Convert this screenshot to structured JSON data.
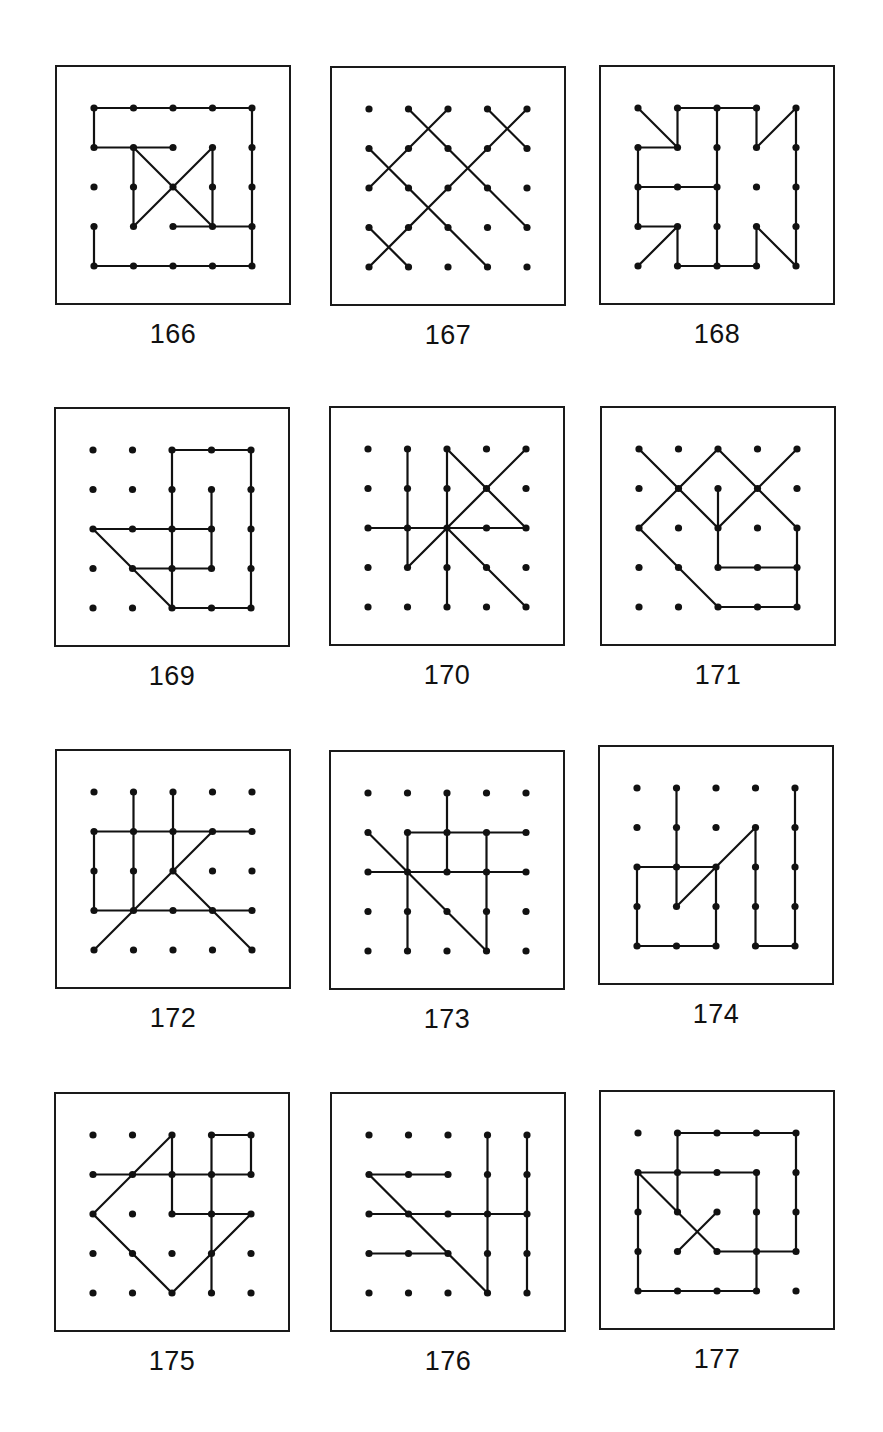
{
  "page": {
    "grid": {
      "cols": 5,
      "rows": 5,
      "spacing": 39.5,
      "inset_x": 37,
      "inset_y": 41
    },
    "colors": {
      "line": "#111111",
      "dot": "#111111",
      "border": "#1a1a1a",
      "background": "#ffffff"
    }
  },
  "panels": [
    {
      "number": "166",
      "x": 55,
      "y": 65,
      "lines": [
        [
          0,
          0,
          4,
          0
        ],
        [
          0,
          0,
          0,
          1
        ],
        [
          0,
          1,
          2,
          1
        ],
        [
          1,
          1,
          1,
          3
        ],
        [
          1,
          1,
          3,
          3
        ],
        [
          3,
          1,
          1,
          3
        ],
        [
          3,
          1,
          3,
          3
        ],
        [
          2,
          3,
          4,
          3
        ],
        [
          4,
          0,
          4,
          4
        ],
        [
          0,
          3,
          0,
          4
        ],
        [
          0,
          4,
          4,
          4
        ]
      ]
    },
    {
      "number": "167",
      "x": 330,
      "y": 66,
      "lines": [
        [
          2,
          0,
          0,
          2
        ],
        [
          1,
          0,
          4,
          3
        ],
        [
          3,
          0,
          4,
          1
        ],
        [
          4,
          0,
          0,
          4
        ],
        [
          0,
          1,
          3,
          4
        ],
        [
          0,
          3,
          1,
          4
        ]
      ]
    },
    {
      "number": "168",
      "x": 599,
      "y": 65,
      "lines": [
        [
          0,
          0,
          1,
          1
        ],
        [
          1,
          0,
          1,
          1
        ],
        [
          1,
          0,
          3,
          0
        ],
        [
          2,
          0,
          2,
          4
        ],
        [
          3,
          0,
          3,
          1
        ],
        [
          3,
          1,
          4,
          0
        ],
        [
          4,
          0,
          4,
          4
        ],
        [
          0,
          1,
          1,
          1
        ],
        [
          0,
          1,
          0,
          3
        ],
        [
          0,
          2,
          2,
          2
        ],
        [
          0,
          3,
          1,
          3
        ],
        [
          1,
          3,
          0,
          4
        ],
        [
          1,
          3,
          1,
          4
        ],
        [
          1,
          4,
          3,
          4
        ],
        [
          3,
          3,
          3,
          4
        ],
        [
          3,
          3,
          4,
          4
        ]
      ]
    },
    {
      "number": "169",
      "x": 54,
      "y": 407,
      "lines": [
        [
          2,
          0,
          4,
          0
        ],
        [
          2,
          0,
          2,
          4
        ],
        [
          4,
          0,
          4,
          4
        ],
        [
          3,
          1,
          3,
          3
        ],
        [
          0,
          2,
          3,
          2
        ],
        [
          0,
          2,
          2,
          4
        ],
        [
          1,
          3,
          3,
          3
        ],
        [
          2,
          4,
          4,
          4
        ]
      ]
    },
    {
      "number": "170",
      "x": 329,
      "y": 406,
      "lines": [
        [
          1,
          0,
          1,
          3
        ],
        [
          2,
          0,
          2,
          4
        ],
        [
          2,
          0,
          4,
          2
        ],
        [
          4,
          0,
          1,
          3
        ],
        [
          0,
          2,
          4,
          2
        ],
        [
          2,
          2,
          4,
          4
        ]
      ]
    },
    {
      "number": "171",
      "x": 600,
      "y": 406,
      "lines": [
        [
          0,
          0,
          2,
          2
        ],
        [
          2,
          0,
          0,
          2
        ],
        [
          2,
          0,
          4,
          2
        ],
        [
          4,
          0,
          2,
          2
        ],
        [
          2,
          1,
          2,
          3
        ],
        [
          0,
          2,
          2,
          4
        ],
        [
          2,
          3,
          4,
          3
        ],
        [
          4,
          2,
          4,
          4
        ],
        [
          2,
          4,
          4,
          4
        ]
      ]
    },
    {
      "number": "172",
      "x": 55,
      "y": 749,
      "lines": [
        [
          1,
          0,
          1,
          3
        ],
        [
          2,
          0,
          2,
          2
        ],
        [
          0,
          1,
          4,
          1
        ],
        [
          0,
          1,
          0,
          3
        ],
        [
          3,
          1,
          0,
          4
        ],
        [
          0,
          3,
          4,
          3
        ],
        [
          2,
          2,
          4,
          4
        ]
      ]
    },
    {
      "number": "173",
      "x": 329,
      "y": 750,
      "lines": [
        [
          2,
          0,
          2,
          2
        ],
        [
          1,
          1,
          4,
          1
        ],
        [
          1,
          1,
          1,
          4
        ],
        [
          3,
          1,
          3,
          4
        ],
        [
          0,
          1,
          3,
          4
        ],
        [
          0,
          2,
          4,
          2
        ]
      ]
    },
    {
      "number": "174",
      "x": 598,
      "y": 745,
      "lines": [
        [
          1,
          0,
          1,
          3
        ],
        [
          4,
          0,
          4,
          4
        ],
        [
          3,
          1,
          1,
          3
        ],
        [
          3,
          1,
          3,
          4
        ],
        [
          0,
          2,
          2,
          2
        ],
        [
          0,
          2,
          0,
          4
        ],
        [
          2,
          2,
          2,
          4
        ],
        [
          0,
          4,
          2,
          4
        ],
        [
          3,
          4,
          4,
          4
        ]
      ]
    },
    {
      "number": "175",
      "x": 54,
      "y": 1092,
      "lines": [
        [
          2,
          0,
          0,
          2
        ],
        [
          2,
          0,
          2,
          2
        ],
        [
          3,
          0,
          4,
          0
        ],
        [
          3,
          0,
          3,
          4
        ],
        [
          4,
          0,
          4,
          1
        ],
        [
          0,
          1,
          4,
          1
        ],
        [
          2,
          2,
          4,
          2
        ],
        [
          0,
          2,
          2,
          4
        ],
        [
          4,
          2,
          2,
          4
        ]
      ]
    },
    {
      "number": "176",
      "x": 330,
      "y": 1092,
      "lines": [
        [
          3,
          0,
          3,
          4
        ],
        [
          4,
          0,
          4,
          4
        ],
        [
          0,
          1,
          2,
          1
        ],
        [
          0,
          1,
          3,
          4
        ],
        [
          0,
          2,
          4,
          2
        ],
        [
          0,
          3,
          2,
          3
        ]
      ]
    },
    {
      "number": "177",
      "x": 599,
      "y": 1090,
      "lines": [
        [
          1,
          0,
          4,
          0
        ],
        [
          1,
          0,
          1,
          2
        ],
        [
          4,
          0,
          4,
          3
        ],
        [
          0,
          1,
          3,
          1
        ],
        [
          0,
          1,
          0,
          4
        ],
        [
          0,
          1,
          2,
          3
        ],
        [
          2,
          2,
          1,
          3
        ],
        [
          3,
          1,
          3,
          4
        ],
        [
          2,
          3,
          4,
          3
        ],
        [
          0,
          4,
          3,
          4
        ]
      ]
    }
  ]
}
